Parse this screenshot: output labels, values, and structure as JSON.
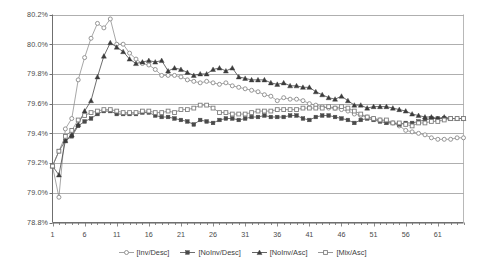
{
  "chart_data": {
    "type": "line",
    "title": "",
    "subtitle": "",
    "xlabel": "",
    "ylabel": "",
    "grid": true,
    "legend_position": "bottom",
    "xlim": [
      1,
      65
    ],
    "ylim": [
      78.8,
      80.2
    ],
    "y_tick_labels": [
      "80.2%",
      "80.0%",
      "79.8%",
      "79.6%",
      "79.4%",
      "79.2%",
      "79.0%",
      "78.8%"
    ],
    "y_tick_values": [
      80.2,
      80.0,
      79.8,
      79.6,
      79.4,
      79.2,
      79.0,
      78.8
    ],
    "x_tick_labels": [
      "1",
      "6",
      "11",
      "16",
      "21",
      "26",
      "31",
      "36",
      "41",
      "46",
      "51",
      "56",
      "61"
    ],
    "x_tick_values": [
      1,
      6,
      11,
      16,
      21,
      26,
      31,
      36,
      41,
      46,
      51,
      56,
      61
    ],
    "x_minor_tick_step": 1,
    "x": [
      1,
      2,
      3,
      4,
      5,
      6,
      7,
      8,
      9,
      10,
      11,
      12,
      13,
      14,
      15,
      16,
      17,
      18,
      19,
      20,
      21,
      22,
      23,
      24,
      25,
      26,
      27,
      28,
      29,
      30,
      31,
      32,
      33,
      34,
      35,
      36,
      37,
      38,
      39,
      40,
      41,
      42,
      43,
      44,
      45,
      46,
      47,
      48,
      49,
      50,
      51,
      52,
      53,
      54,
      55,
      56,
      57,
      58,
      59,
      60,
      61,
      62,
      63,
      64,
      65
    ],
    "series": [
      {
        "name": "[Inv/Desc]",
        "marker": "open-circle",
        "color": "#8a8a8a",
        "values": [
          79.18,
          78.97,
          79.43,
          79.5,
          79.76,
          79.91,
          80.04,
          80.14,
          80.11,
          80.17,
          80.0,
          80.0,
          79.94,
          79.9,
          79.87,
          79.86,
          79.83,
          79.79,
          79.79,
          79.79,
          79.78,
          79.76,
          79.75,
          79.74,
          79.75,
          79.74,
          79.73,
          79.74,
          79.72,
          79.71,
          79.7,
          79.69,
          79.68,
          79.66,
          79.65,
          79.62,
          79.64,
          79.63,
          79.63,
          79.62,
          79.6,
          79.59,
          79.58,
          79.57,
          79.57,
          79.56,
          79.55,
          79.53,
          79.52,
          79.51,
          79.5,
          79.49,
          79.48,
          79.47,
          79.45,
          79.42,
          79.41,
          79.4,
          79.39,
          79.37,
          79.36,
          79.36,
          79.36,
          79.37,
          79.37
        ]
      },
      {
        "name": "[NoInv/Desc]",
        "marker": "filled-square",
        "color": "#4a4a4a",
        "values": [
          79.18,
          79.28,
          79.35,
          79.38,
          79.45,
          79.48,
          79.5,
          79.53,
          79.55,
          79.55,
          79.53,
          79.53,
          79.53,
          79.53,
          79.54,
          79.54,
          79.52,
          79.51,
          79.51,
          79.5,
          79.49,
          79.48,
          79.46,
          79.49,
          79.48,
          79.47,
          79.49,
          79.5,
          79.5,
          79.49,
          79.5,
          79.51,
          79.51,
          79.52,
          79.51,
          79.51,
          79.51,
          79.52,
          79.52,
          79.5,
          79.49,
          79.51,
          79.52,
          79.52,
          79.51,
          79.5,
          79.49,
          79.47,
          79.49,
          79.5,
          79.49,
          79.48,
          79.47,
          79.47,
          79.46,
          79.47,
          79.47,
          79.48,
          79.49,
          79.5,
          79.5,
          79.5,
          79.5,
          79.5,
          79.5
        ]
      },
      {
        "name": "[NoInv/Asc]",
        "marker": "filled-triangle",
        "color": "#3c3c3c",
        "values": [
          79.18,
          79.12,
          79.35,
          79.39,
          79.46,
          79.55,
          79.62,
          79.78,
          79.92,
          80.01,
          79.98,
          79.95,
          79.9,
          79.87,
          79.88,
          79.89,
          79.88,
          79.89,
          79.82,
          79.84,
          79.83,
          79.81,
          79.79,
          79.8,
          79.8,
          79.83,
          79.84,
          79.82,
          79.84,
          79.78,
          79.77,
          79.76,
          79.76,
          79.76,
          79.74,
          79.73,
          79.74,
          79.72,
          79.72,
          79.71,
          79.71,
          79.68,
          79.66,
          79.64,
          79.63,
          79.65,
          79.62,
          79.59,
          79.59,
          79.57,
          79.58,
          79.58,
          79.58,
          79.57,
          79.56,
          79.55,
          79.53,
          79.52,
          79.51,
          79.51,
          79.5,
          79.51,
          79.5,
          79.5,
          79.5
        ]
      },
      {
        "name": "[Mix/Asc]",
        "marker": "open-square",
        "color": "#7d7d7d",
        "values": [
          79.18,
          79.28,
          79.38,
          79.42,
          79.49,
          79.52,
          79.54,
          79.55,
          79.56,
          79.56,
          79.55,
          79.54,
          79.54,
          79.54,
          79.55,
          79.55,
          79.54,
          79.54,
          79.55,
          79.54,
          79.56,
          79.56,
          79.57,
          79.59,
          79.59,
          79.57,
          79.54,
          79.54,
          79.53,
          79.53,
          79.53,
          79.54,
          79.55,
          79.55,
          79.55,
          79.56,
          79.56,
          79.56,
          79.56,
          79.57,
          79.57,
          79.57,
          79.57,
          79.58,
          79.57,
          79.58,
          79.57,
          79.55,
          79.53,
          79.51,
          79.5,
          79.49,
          79.49,
          79.47,
          79.47,
          79.46,
          79.45,
          79.47,
          79.47,
          79.48,
          79.48,
          79.49,
          79.5,
          79.5,
          79.5
        ]
      }
    ]
  },
  "legend": {
    "entries": [
      {
        "label": "[Inv/Desc]",
        "marker": "open-circle"
      },
      {
        "label": "[NoInv/Desc]",
        "marker": "filled-square"
      },
      {
        "label": "[NoInv/Asc]",
        "marker": "filled-triangle"
      },
      {
        "label": "[Mix/Asc]",
        "marker": "open-square"
      }
    ]
  },
  "colors": {
    "grid": "#9a9a9a",
    "axis": "#6f6f6f",
    "background": "#ffffff",
    "text": "#4a4a4a"
  }
}
